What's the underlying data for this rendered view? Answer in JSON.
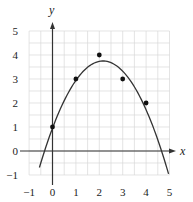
{
  "chart_data": {
    "type": "scatter",
    "title": "",
    "xlabel": "x",
    "ylabel": "y",
    "xlim": [
      -1,
      5
    ],
    "ylim": [
      -1,
      5
    ],
    "grid": true,
    "grid_step": 0.5,
    "x_ticks": [
      "-1",
      "0",
      "1",
      "2",
      "3",
      "4",
      "5"
    ],
    "y_ticks": [
      "-1",
      "0",
      "1",
      "2",
      "3",
      "4",
      "5"
    ],
    "x_tick_values": [
      -1,
      0,
      1,
      2,
      3,
      4,
      5
    ],
    "y_tick_values": [
      -1,
      0,
      1,
      2,
      3,
      4,
      5
    ],
    "series": [
      {
        "name": "data points",
        "type": "scatter",
        "points": [
          [
            0,
            1
          ],
          [
            1,
            3
          ],
          [
            2,
            4
          ],
          [
            3,
            3
          ],
          [
            4,
            2
          ]
        ]
      },
      {
        "name": "quadratic fit",
        "type": "line",
        "equation": "y = -0.6x^2 + 2.592x + 0.951",
        "coefficients": {
          "a": -0.6,
          "b": 2.592,
          "c": 0.951
        },
        "x_range": [
          -0.56,
          4.96
        ]
      }
    ]
  },
  "colors": {
    "axis": "#333333",
    "grid": "#d9d9d9",
    "curve": "#333333",
    "points": "#111111"
  }
}
